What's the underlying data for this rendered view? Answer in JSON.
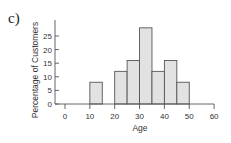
{
  "panel_label": "c)",
  "chart_data": {
    "type": "bar",
    "subtype": "histogram",
    "title": "",
    "xlabel": "Age",
    "ylabel": "Percentage of Customers",
    "bins": [
      [
        10,
        15
      ],
      [
        20,
        25
      ],
      [
        25,
        30
      ],
      [
        30,
        35
      ],
      [
        35,
        40
      ],
      [
        40,
        45
      ],
      [
        45,
        50
      ]
    ],
    "categories": [
      "10-15",
      "20-25",
      "25-30",
      "30-35",
      "35-40",
      "40-45",
      "45-50"
    ],
    "values": [
      8,
      12,
      16,
      28,
      12,
      16,
      8
    ],
    "xlim": [
      0,
      60
    ],
    "ylim": [
      0,
      30
    ],
    "xticks": [
      0,
      10,
      20,
      30,
      40,
      50,
      60
    ],
    "yticks": [
      0,
      5,
      10,
      15,
      20,
      25
    ],
    "grid": false,
    "legend": null,
    "colors": {
      "bar_fill": "#e2e2e2",
      "bar_stroke": "#555555",
      "axis": "#555555"
    }
  }
}
